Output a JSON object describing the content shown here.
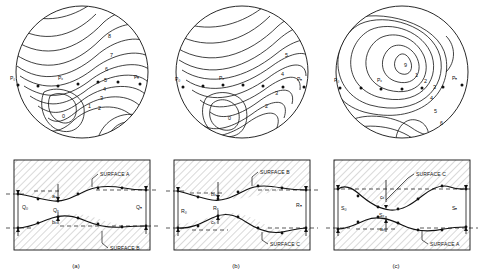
{
  "figure": {
    "panels": [
      {
        "caption": "(a)",
        "map": {
          "points": [
            "P₀",
            "Pₓ",
            "Pₙ"
          ],
          "contour_labels": [
            "8",
            "7",
            "6",
            "5",
            "4",
            "3",
            "2",
            "1",
            "0"
          ]
        },
        "section": {
          "upper_surface": "SURFACE A",
          "lower_surface": "SURFACE B",
          "end_left": "Q₀",
          "mid": "Qₓ",
          "end_right": "Qₙ",
          "upper_interval": "aₓ",
          "lower_interval": "bₓ"
        }
      },
      {
        "caption": "(b)",
        "map": {
          "points": [
            "P₀",
            "Pₓ",
            "Pₙ"
          ],
          "contour_labels": [
            "5",
            "4",
            "3",
            "2",
            "0"
          ]
        },
        "section": {
          "upper_surface": "SURFACE B",
          "lower_surface": "SURFACE C",
          "end_left": "R₀",
          "mid": "Rₓ",
          "end_right": "Rₙ",
          "upper_interval": "bₓ",
          "lower_interval": "cₓ"
        }
      },
      {
        "caption": "(c)",
        "map": {
          "points": [
            "P₀",
            "Pₓ",
            "Pₙ"
          ],
          "contour_labels": [
            "9",
            "1",
            "2",
            "3",
            "4",
            "5",
            "6"
          ]
        },
        "section": {
          "upper_surface": "SURFACE C",
          "lower_surface": "SURFACE A",
          "end_left": "S₀",
          "mid": "Sₓ",
          "end_right": "Sₙ",
          "upper_interval": "cₓ",
          "lower_interval": "aₓ"
        }
      }
    ]
  },
  "style": {
    "line_color": "#111111",
    "hatch_color": "#9a9a9a",
    "background": "#ffffff"
  }
}
